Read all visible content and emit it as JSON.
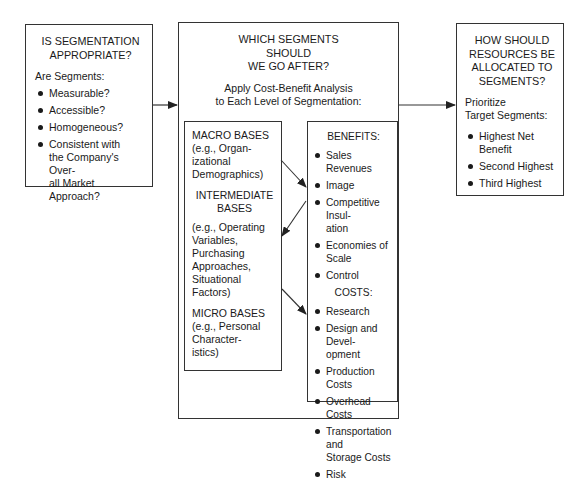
{
  "left_box": {
    "title": "IS SEGMENTATION\nAPPROPRIATE?",
    "subtitle": "Are Segments:",
    "items": [
      "Measurable?",
      "Accessible?",
      "Homogeneous?",
      "Consistent with\nthe Company's Over-\nall Market Approach?"
    ]
  },
  "middle_box": {
    "title": "WHICH SEGMENTS\nSHOULD\nWE GO AFTER?",
    "subtitle": "Apply Cost-Benefit Analysis\nto Each Level of Segmentation:",
    "bases": {
      "macro_title": "MACRO BASES",
      "macro_desc": "(e.g., Organ-\nizational\nDemographics)",
      "intermediate_title": "INTERMEDIATE\nBASES",
      "intermediate_desc": "(e.g., Operating\nVariables,\nPurchasing\nApproaches,\nSituational\nFactors)",
      "micro_title": "MICRO BASES",
      "micro_desc": "(e.g., Personal\nCharacter-\nistics)"
    },
    "benefits": {
      "title": "BENEFITS:",
      "items": [
        "Sales Revenues",
        "Image",
        "Competitive Insul-\nation",
        "Economies of Scale",
        "Control"
      ]
    },
    "costs": {
      "title": "COSTS:",
      "items": [
        "Research",
        "Design and Devel-\nopment",
        "Production Costs",
        "Overhead Costs",
        "Transportation and\nStorage Costs",
        "Risk"
      ]
    }
  },
  "right_box": {
    "title": "HOW SHOULD\nRESOURCES BE\nALLOCATED TO\nSEGMENTS?",
    "subtitle": "Prioritize\nTarget Segments:",
    "items": [
      "Highest Net\nBenefit",
      "Second Highest",
      "Third Highest"
    ]
  },
  "colors": {
    "line": "#333333",
    "text": "#1a1a1a",
    "background": "#ffffff"
  }
}
